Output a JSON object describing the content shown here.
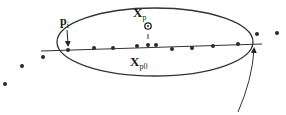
{
  "diagram": {
    "type": "point-line-ellipse-schematic",
    "colors": {
      "background": "#ffffff",
      "stroke": "#333333",
      "point": "#2a2a2a"
    },
    "labels": {
      "p_i": {
        "main": "p",
        "sub": "i"
      },
      "x_p": {
        "main": "X",
        "sub": "p"
      },
      "x_p0": {
        "main": "X",
        "sub": "p0"
      }
    },
    "ellipse": {
      "cx": 155,
      "cy": 42,
      "rx": 98,
      "ry": 34
    },
    "fit_line": {
      "x1": 41,
      "y1": 51,
      "x2": 262,
      "y2": 44
    },
    "line_points": [
      [
        68,
        50
      ],
      [
        94,
        48
      ],
      [
        113,
        48
      ],
      [
        137,
        46
      ],
      [
        148,
        45
      ],
      [
        156,
        45
      ],
      [
        172,
        49
      ],
      [
        192,
        48
      ],
      [
        213,
        46
      ],
      [
        238,
        44
      ]
    ],
    "outlier_points": [
      [
        43,
        57
      ],
      [
        22,
        66
      ],
      [
        5,
        84
      ],
      [
        257,
        34
      ],
      [
        277,
        33
      ]
    ],
    "projected_point": {
      "x": 148,
      "y": 26,
      "r": 3
    },
    "pointer_arrow": {
      "from": [
        66,
        30
      ],
      "to": [
        68,
        47
      ]
    },
    "callout_arrow": {
      "from": [
        238,
        112
      ],
      "to": [
        254,
        47
      ]
    }
  }
}
